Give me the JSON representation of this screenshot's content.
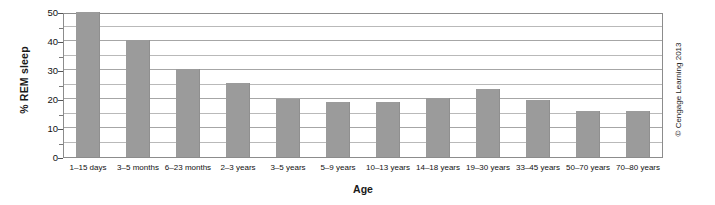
{
  "chart_data": {
    "type": "bar",
    "title": "",
    "xlabel": "Age",
    "ylabel": "% REM sleep",
    "ylim": [
      0,
      50
    ],
    "yticks": [
      0,
      10,
      20,
      30,
      40,
      50
    ],
    "yticks_minor": [
      5,
      15,
      25,
      35,
      45
    ],
    "grid": true,
    "legend": "none",
    "bar_color": "#9b9b9b",
    "categories": [
      "1–15 days",
      "3–5 months",
      "6–23 months",
      "2–3 years",
      "3–5 years",
      "5–9 years",
      "10–13 years",
      "14–18 years",
      "19–30 years",
      "33–45 years",
      "50–70 years",
      "70–80 years"
    ],
    "values": [
      50,
      40.5,
      30.5,
      25.5,
      20,
      19,
      19,
      20.5,
      23.5,
      19.5,
      16,
      16
    ]
  },
  "credit": {
    "symbol": "©",
    "text": "Cengage Learning 2013",
    "full": "© Cengage Learning 2013"
  }
}
